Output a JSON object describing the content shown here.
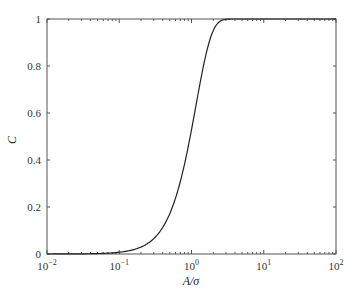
{
  "chart_data": {
    "type": "line",
    "title": "",
    "xlabel": "A/σ",
    "ylabel": "C",
    "xscale": "log",
    "xlim": [
      0.01,
      100
    ],
    "ylim": [
      0,
      1
    ],
    "grid": false,
    "legend": null,
    "x_ticks": [
      "10^-2",
      "10^-1",
      "10^0",
      "10^1",
      "10^2"
    ],
    "y_ticks": [
      "0",
      "0.2",
      "0.4",
      "0.6",
      "0.8",
      "1"
    ],
    "series": [
      {
        "name": "C",
        "color": "#222222",
        "x": [
          0.01,
          0.03,
          0.1,
          0.2,
          0.28,
          0.4,
          0.56,
          0.74,
          0.92,
          1.06,
          1.35,
          1.7,
          2.2,
          2.9,
          4,
          10,
          100
        ],
        "y": [
          0.0,
          0.001,
          0.007,
          0.03,
          0.06,
          0.11,
          0.19,
          0.34,
          0.44,
          0.57,
          0.75,
          0.89,
          0.97,
          1.0,
          1.0,
          1.0,
          1.0
        ]
      }
    ]
  },
  "axes": {
    "x_tick_labels": [
      {
        "base": "10",
        "exp": "−2"
      },
      {
        "base": "10",
        "exp": "−1"
      },
      {
        "base": "10",
        "exp": "0"
      },
      {
        "base": "10",
        "exp": "1"
      },
      {
        "base": "10",
        "exp": "2"
      }
    ],
    "y_tick_labels": [
      "0",
      "0.2",
      "0.4",
      "0.6",
      "0.8",
      "1"
    ],
    "xlabel": "A/σ",
    "ylabel": "C"
  }
}
